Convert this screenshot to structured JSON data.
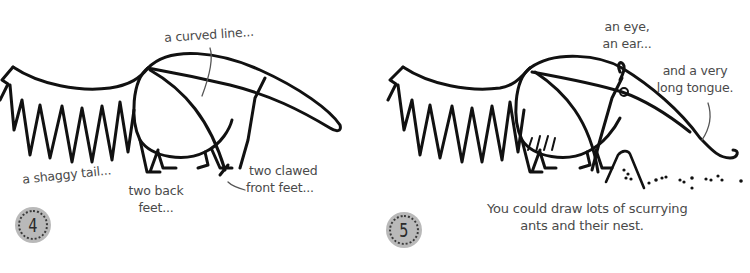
{
  "steps": [
    {
      "number": "4",
      "labels": {
        "curved_line": "a curved line...",
        "shaggy_tail": "a shaggy tail...",
        "back_feet_line1": "two back",
        "back_feet_line2": "feet...",
        "front_feet_line1": "two clawed",
        "front_feet_line2": "front feet..."
      }
    },
    {
      "number": "5",
      "labels": {
        "eye_ear_line1": "an eye,",
        "eye_ear_line2": "an ear...",
        "tongue_line1": "and a very",
        "tongue_line2": "long tongue.",
        "caption_line1": "You could draw lots of scurrying",
        "caption_line2": "ants and their nest."
      }
    }
  ],
  "colors": {
    "ink": "#111111",
    "label_text": "#4a4a4a",
    "badge_fill": "#b9b9b9"
  }
}
